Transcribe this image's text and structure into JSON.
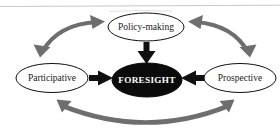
{
  "diagram": {
    "colors": {
      "node_fill": "#ffffff",
      "node_stroke": "#111111",
      "center_fill": "#0b0b0b",
      "center_text": "#ffffff",
      "solid_arrow": "#101010",
      "curved_arrow": "#6e6e6e",
      "background": "#ffffff",
      "scan_artifact": "#b9b9b9"
    },
    "nodes": [
      {
        "id": "policy-making",
        "label": "Policy-making",
        "position": "top",
        "style": "outline",
        "cx": 146,
        "cy": 27,
        "rx": 38,
        "ry": 14
      },
      {
        "id": "participative",
        "label": "Participative",
        "position": "left",
        "style": "outline",
        "cx": 52,
        "cy": 78,
        "rx": 36,
        "ry": 14.5
      },
      {
        "id": "foresight",
        "label": "FORESIGHT",
        "position": "center",
        "style": "filled",
        "cx": 147,
        "cy": 80,
        "rx": 35,
        "ry": 17
      },
      {
        "id": "prospective",
        "label": "Prospective",
        "position": "right",
        "style": "outline",
        "cx": 240,
        "cy": 78,
        "rx": 36,
        "ry": 14.5
      }
    ],
    "solid_arrows": [
      {
        "id": "policy-to-foresight",
        "from": "policy-making",
        "to": "foresight",
        "direction": "down",
        "color": "#101010"
      },
      {
        "id": "participative-to-foresight",
        "from": "participative",
        "to": "foresight",
        "direction": "right",
        "color": "#101010"
      },
      {
        "id": "prospective-to-foresight",
        "from": "prospective",
        "to": "foresight",
        "direction": "left",
        "color": "#101010"
      }
    ],
    "curved_arrows": [
      {
        "id": "participative-policy-link",
        "from": "participative",
        "to": "policy-making",
        "double_headed": true,
        "color": "#6e6e6e"
      },
      {
        "id": "policy-prospective-link",
        "from": "policy-making",
        "to": "prospective",
        "double_headed": true,
        "color": "#6e6e6e"
      },
      {
        "id": "participative-prospective-link",
        "from": "participative",
        "to": "prospective",
        "double_headed": true,
        "color": "#6e6e6e"
      }
    ]
  }
}
